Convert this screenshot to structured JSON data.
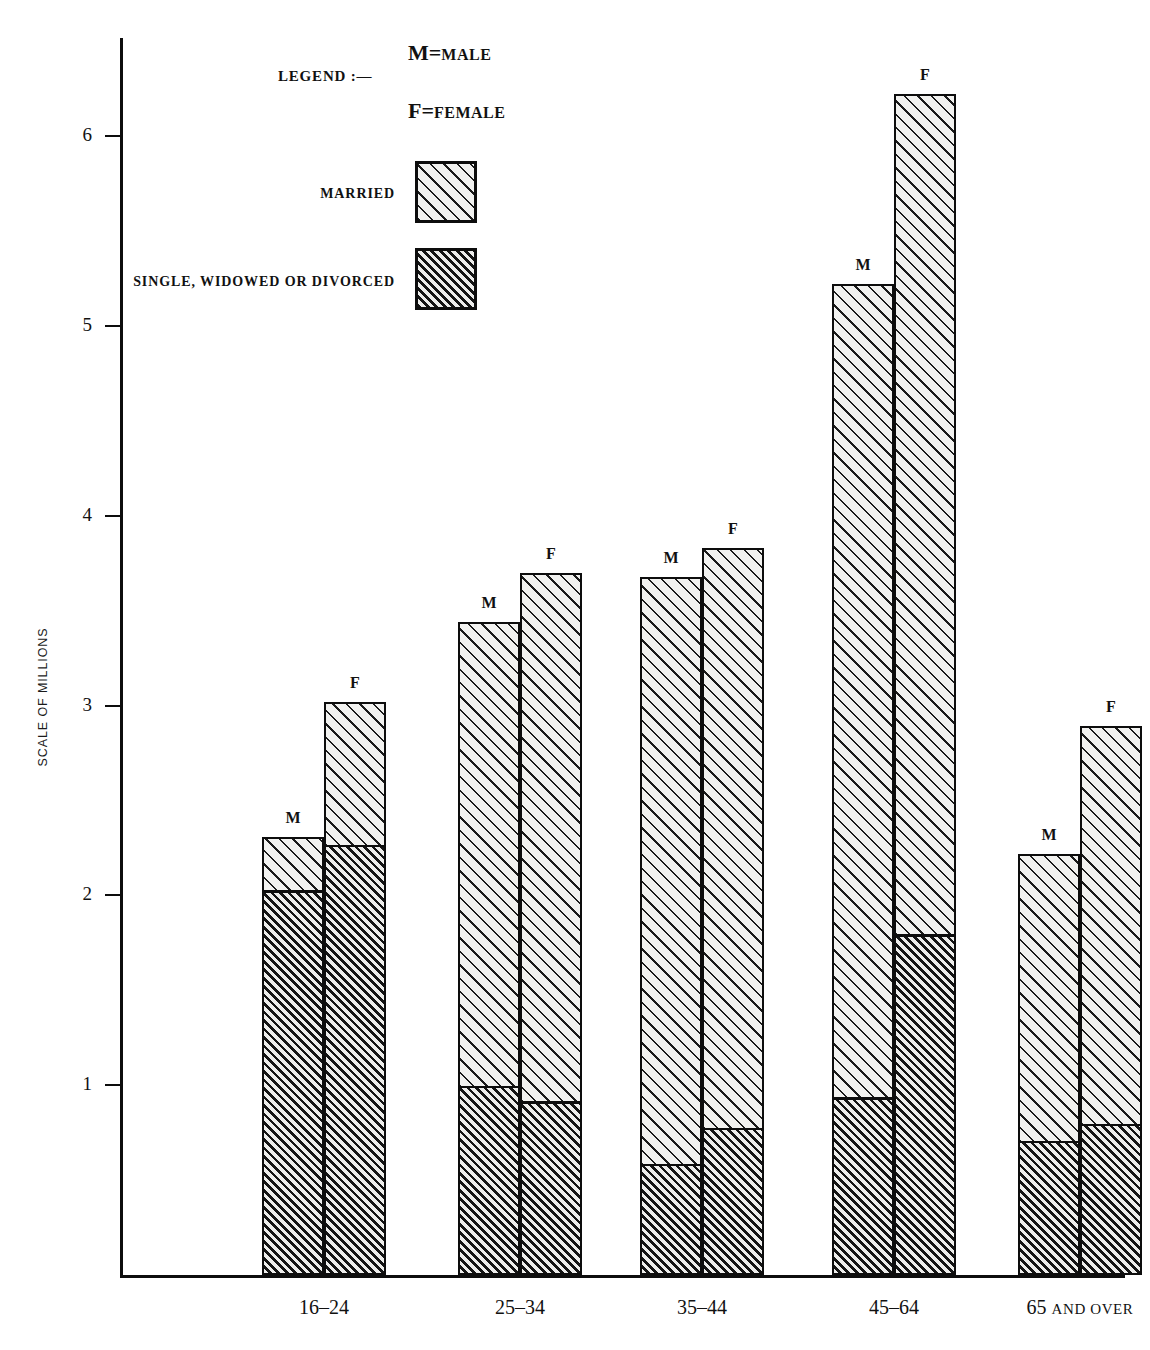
{
  "chart_data": {
    "type": "bar",
    "title": "",
    "xlabel": "",
    "ylabel": "SCALE OF MILLIONS",
    "ylim": [
      0,
      6.6
    ],
    "grid": false,
    "stacked": true,
    "categories": [
      "16–24",
      "25–34",
      "35–44",
      "45–64",
      "65 AND OVER"
    ],
    "y_ticks": [
      "1",
      "2",
      "3",
      "4",
      "5",
      "6"
    ],
    "y_tick_values": [
      1,
      2,
      3,
      4,
      5,
      6
    ],
    "legend_position": "top-left",
    "series": [
      {
        "name": "MARRIED",
        "sex": "M",
        "values": [
          0.28,
          2.44,
          3.09,
          4.28,
          1.51
        ]
      },
      {
        "name": "SINGLE, WIDOWED OR DIVORCED",
        "sex": "M",
        "values": [
          2.03,
          1.0,
          0.59,
          0.94,
          0.71
        ]
      },
      {
        "name": "MARRIED",
        "sex": "F",
        "values": [
          0.75,
          2.78,
          3.05,
          4.42,
          2.09
        ]
      },
      {
        "name": "SINGLE, WIDOWED OR DIVORCED",
        "sex": "F",
        "values": [
          2.27,
          0.92,
          0.78,
          1.8,
          0.8
        ]
      }
    ],
    "groups": [
      {
        "category": "16–24",
        "bars": [
          {
            "letter": "M",
            "total": 2.31,
            "married": 0.28,
            "single": 2.03
          },
          {
            "letter": "F",
            "total": 3.02,
            "married": 0.75,
            "single": 2.27
          }
        ]
      },
      {
        "category": "25–34",
        "bars": [
          {
            "letter": "M",
            "total": 3.44,
            "married": 2.44,
            "single": 1.0
          },
          {
            "letter": "F",
            "total": 3.7,
            "married": 2.78,
            "single": 0.92
          }
        ]
      },
      {
        "category": "35–44",
        "bars": [
          {
            "letter": "M",
            "total": 3.68,
            "married": 3.09,
            "single": 0.59
          },
          {
            "letter": "F",
            "total": 3.83,
            "married": 3.05,
            "single": 0.78
          }
        ]
      },
      {
        "category": "45–64",
        "bars": [
          {
            "letter": "M",
            "total": 5.22,
            "married": 4.28,
            "single": 0.94
          },
          {
            "letter": "F",
            "total": 6.22,
            "married": 4.42,
            "single": 1.8
          }
        ]
      },
      {
        "category": "65 AND OVER",
        "bars": [
          {
            "letter": "M",
            "total": 2.22,
            "married": 1.51,
            "single": 0.71
          },
          {
            "letter": "F",
            "total": 2.89,
            "married": 2.09,
            "single": 0.8
          }
        ]
      }
    ]
  },
  "axis": {
    "y_title": "SCALE OF MILLIONS",
    "ticks": [
      {
        "label": "6",
        "value": 6
      },
      {
        "label": "5",
        "value": 5
      },
      {
        "label": "4",
        "value": 4
      },
      {
        "label": "3",
        "value": 3
      },
      {
        "label": "2",
        "value": 2
      },
      {
        "label": "1",
        "value": 1
      }
    ]
  },
  "categories": [
    {
      "label": "16–24",
      "main": "16–24",
      "suffix": ""
    },
    {
      "label": "25–34",
      "main": "25–34",
      "suffix": ""
    },
    {
      "label": "35–44",
      "main": "35–44",
      "suffix": ""
    },
    {
      "label": "45–64",
      "main": "45–64",
      "suffix": ""
    },
    {
      "label": "65 AND OVER",
      "main": "65",
      "suffix": "AND OVER"
    }
  ],
  "legend": {
    "title": "LEGEND :—",
    "male_glyph": "M",
    "male_equals": "=",
    "male_word": "MALE",
    "female_glyph": "F",
    "female_equals": "=",
    "female_word": "FEMALE",
    "keys": [
      {
        "label": "MARRIED",
        "pattern": "sparse-diagonal-hatch"
      },
      {
        "label": "SINGLE, WIDOWED OR DIVORCED",
        "pattern": "dense-diagonal-hatch"
      }
    ]
  },
  "colors": {
    "ink": "#0d0d0d",
    "paper": "#ffffff",
    "married_fill": "#f2f2f0",
    "single_fill": "#ededeb"
  }
}
